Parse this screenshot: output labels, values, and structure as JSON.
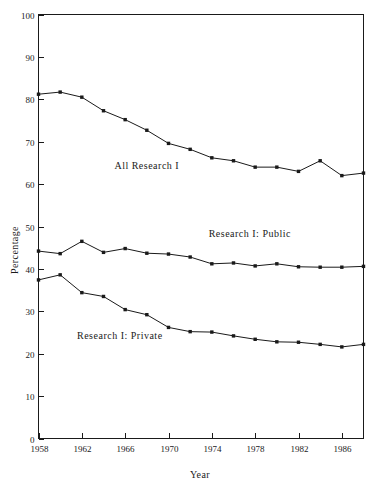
{
  "chart_data": {
    "type": "line",
    "title": "",
    "xlabel": "Year",
    "ylabel": "Percentage",
    "xlim": [
      1958,
      1988
    ],
    "ylim": [
      0,
      100
    ],
    "grid": false,
    "legend_position": "inline-annotation",
    "x": [
      1958,
      1960,
      1962,
      1964,
      1966,
      1968,
      1970,
      1972,
      1974,
      1976,
      1978,
      1980,
      1982,
      1984,
      1986,
      1988
    ],
    "x_ticks": [
      1958,
      1962,
      1966,
      1970,
      1974,
      1978,
      1982,
      1986
    ],
    "x_tick_labels": [
      "1958",
      "1962",
      "1966",
      "1970",
      "1974",
      "1978",
      "1982",
      "1986"
    ],
    "y_ticks": [
      0,
      10,
      20,
      30,
      40,
      50,
      60,
      70,
      80,
      90,
      100
    ],
    "y_tick_labels": [
      "0",
      "10",
      "20",
      "30",
      "40",
      "50",
      "60",
      "70",
      "80",
      "90",
      "100"
    ],
    "series": [
      {
        "name": "All Research I",
        "label_x": 1968,
        "label_y": 63.5,
        "values": [
          81.2,
          81.7,
          80.5,
          77.3,
          75.2,
          72.7,
          69.6,
          68.2,
          66.2,
          65.5,
          64.0,
          64.0,
          63.0,
          65.5,
          62.0,
          62.6
        ]
      },
      {
        "name": "Research I: Public",
        "label_x": 1977.5,
        "label_y": 47.5,
        "values": [
          44.2,
          43.6,
          46.5,
          43.9,
          44.8,
          43.7,
          43.5,
          42.8,
          41.2,
          41.4,
          40.7,
          41.2,
          40.5,
          40.4,
          40.4,
          40.6
        ]
      },
      {
        "name": "Research I: Private",
        "label_x": 1965.5,
        "label_y": 23.5,
        "values": [
          37.4,
          38.6,
          34.4,
          33.5,
          30.4,
          29.2,
          26.2,
          25.2,
          25.1,
          24.2,
          23.4,
          22.8,
          22.7,
          22.2,
          21.6,
          22.2
        ]
      }
    ]
  },
  "axes": {
    "y_axis_title": "Percentage",
    "x_axis_title": "Year"
  }
}
